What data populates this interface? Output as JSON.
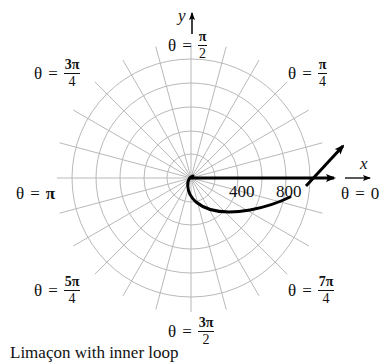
{
  "chart_data": {
    "type": "polar",
    "title": "",
    "caption": "Limaçon with inner loop",
    "grid": {
      "on": true,
      "rings": 5,
      "ring_spacing_units": 200,
      "spokes_every_deg": 15,
      "color": "#b4b4b4"
    },
    "axes": {
      "x_label": "x",
      "y_label": "y",
      "tick_labels": [
        "400",
        "800"
      ]
    },
    "angle_labels": [
      {
        "theta": "0",
        "text_lhs": "θ",
        "eq": "=",
        "num": "0",
        "den": ""
      },
      {
        "theta": "π/4",
        "text_lhs": "θ",
        "eq": "=",
        "num": "π",
        "den": "4"
      },
      {
        "theta": "π/2",
        "text_lhs": "θ",
        "eq": "=",
        "num": "π",
        "den": "2"
      },
      {
        "theta": "3π/4",
        "text_lhs": "θ",
        "eq": "=",
        "num": "3π",
        "den": "4"
      },
      {
        "theta": "π",
        "text_lhs": "θ",
        "eq": "=",
        "num": "π",
        "den": ""
      },
      {
        "theta": "5π/4",
        "text_lhs": "θ",
        "eq": "=",
        "num": "5π",
        "den": "4"
      },
      {
        "theta": "3π/2",
        "text_lhs": "θ",
        "eq": "=",
        "num": "3π",
        "den": "2"
      },
      {
        "theta": "7π/4",
        "text_lhs": "θ",
        "eq": "=",
        "num": "7π",
        "den": "4"
      }
    ],
    "series": [
      {
        "name": "ray theta=0",
        "type": "arrow",
        "from": [
          0,
          0
        ],
        "to": [
          1150,
          0
        ]
      },
      {
        "name": "curve",
        "type": "line",
        "description": "curve leaving pole downward, sweeping below the x-axis and rising to cross the x-axis near r≈950, ending in an arrow up-right"
      }
    ],
    "colors": {
      "curve": "#000000",
      "grid": "#b4b4b4",
      "text": "#111111"
    }
  },
  "labels": {
    "y": "y",
    "x": "x",
    "t400": "400",
    "t800": "800",
    "theta": "θ",
    "eq": "=",
    "pi": "π",
    "zero": "0",
    "n_pi": "π",
    "n_3pi": "3π",
    "n_5pi": "5π",
    "n_7pi": "7π",
    "d2": "2",
    "d4": "4",
    "caption": "Limaçon with inner loop"
  }
}
